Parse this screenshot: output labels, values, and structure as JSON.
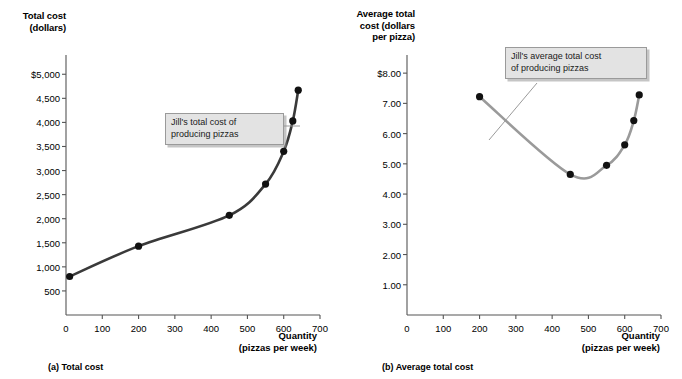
{
  "figure": {
    "panels": [
      {
        "id": "a",
        "caption": "(a) Total cost",
        "y_axis_title": "Total cost\n(dollars)",
        "x_axis_title": "Quantity\n(pizzas per week)"
      },
      {
        "id": "b",
        "caption": "(b) Average total cost",
        "y_axis_title": "Average total\ncost (dollars\nper pizza)",
        "x_axis_title": "Quantity\n(pizzas per week)"
      }
    ],
    "annotations": {
      "total_cost_callout": "Jill's total cost of\nproducing pizzas",
      "average_total_cost_callout": "Jill's average total cost\nof producing pizzas"
    },
    "colors": {
      "total_cost_curve": "#3a3a3a",
      "average_total_cost_curve": "#9a9a9a",
      "marker": "#111111",
      "axis": "#555555",
      "callout_fill": "#e3e3e3"
    }
  },
  "chart_data": [
    {
      "type": "line",
      "title": "(a) Total cost",
      "series_name": "Jill's total cost of producing pizzas",
      "xlabel": "Quantity (pizzas per week)",
      "ylabel": "Total cost (dollars)",
      "xlim": [
        0,
        700
      ],
      "ylim": [
        0,
        5400
      ],
      "grid": false,
      "legend": "none",
      "xticks": [
        0,
        100,
        200,
        300,
        400,
        500,
        600,
        700
      ],
      "xtick_labels": [
        "0",
        "100",
        "200",
        "300",
        "400",
        "500",
        "600",
        "700"
      ],
      "yticks": [
        500,
        1000,
        1500,
        2000,
        2500,
        3000,
        3500,
        4000,
        4500,
        5000
      ],
      "ytick_labels": [
        "500",
        "1,000",
        "1,500",
        "2,000",
        "2,500",
        "3,000",
        "3,500",
        "4,000",
        "4,500",
        "$5,000"
      ],
      "x": [
        10,
        200,
        450,
        550,
        600,
        625,
        640
      ],
      "y": [
        800,
        1430,
        2070,
        2720,
        3400,
        4030,
        4670
      ]
    },
    {
      "type": "line",
      "title": "(b) Average total cost",
      "series_name": "Jill's average total cost of producing pizzas",
      "xlabel": "Quantity (pizzas per week)",
      "ylabel": "Average total cost (dollars per pizza)",
      "xlim": [
        0,
        700
      ],
      "ylim": [
        0,
        8.6
      ],
      "grid": false,
      "legend": "none",
      "xticks": [
        0,
        100,
        200,
        300,
        400,
        500,
        600,
        700
      ],
      "xtick_labels": [
        "0",
        "100",
        "200",
        "300",
        "400",
        "500",
        "600",
        "700"
      ],
      "yticks": [
        1.0,
        2.0,
        3.0,
        4.0,
        5.0,
        6.0,
        7.0,
        8.0
      ],
      "ytick_labels": [
        "1.00",
        "2.00",
        "3.00",
        "4.00",
        "5.00",
        "6.00",
        "7.00",
        "$8.00"
      ],
      "x": [
        200,
        450,
        550,
        600,
        625,
        640
      ],
      "y": [
        7.22,
        4.65,
        4.95,
        5.63,
        6.43,
        7.28
      ]
    }
  ]
}
